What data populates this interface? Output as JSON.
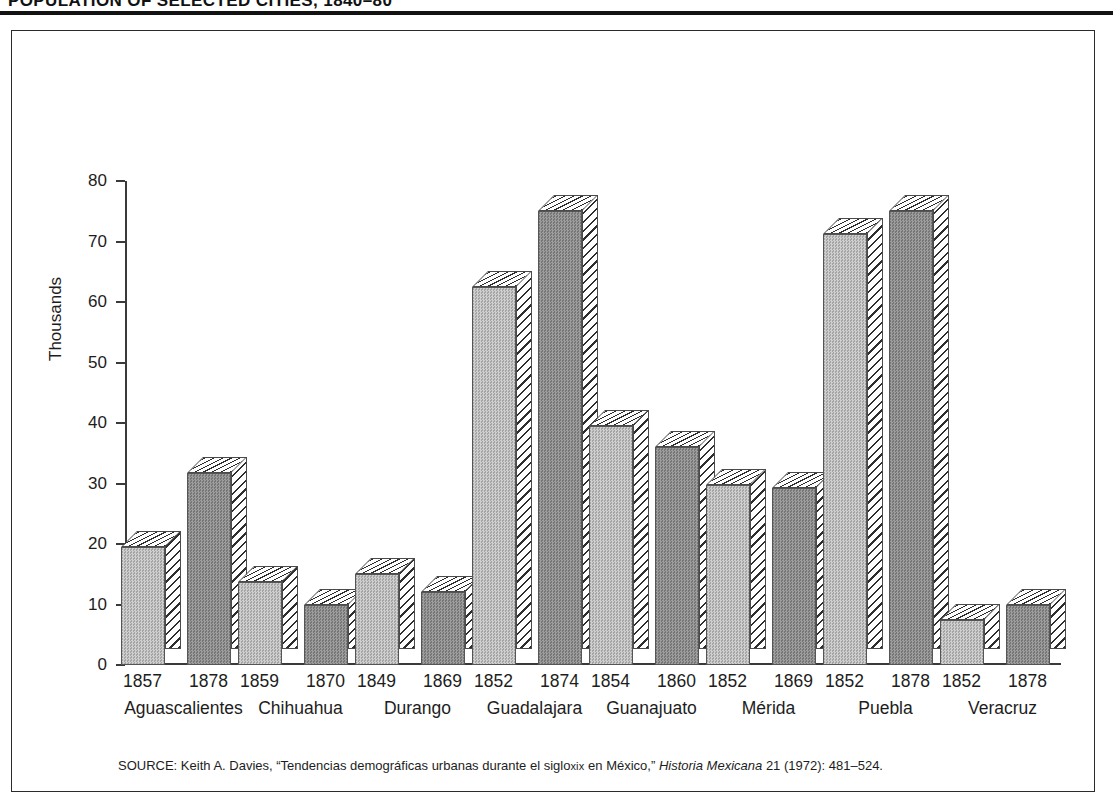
{
  "figure": {
    "title": "POPULATION OF SELECTED CITIES, 1840–80",
    "frame_color": "#2b2b2b"
  },
  "source_note": {
    "prefix": "SOURCE:",
    "author": "Keith A. Davies,",
    "article_open_quote": "“",
    "article_part1": "Tendencias demográficas urbanas durante el siglo",
    "article_smallcaps": "xix",
    "article_part2": "en México,",
    "article_close_quote": "”",
    "journal": "Historia Mexicana",
    "citation": "21 (1972): 481–524."
  },
  "chart_data": {
    "type": "bar",
    "title": "POPULATION OF SELECTED CITIES, 1840–80",
    "xlabel": "",
    "ylabel": "Thousands",
    "ylim": [
      0,
      80
    ],
    "yticks": [
      0,
      10,
      20,
      30,
      40,
      50,
      60,
      70,
      80
    ],
    "ytick_labels": [
      "0",
      "10",
      "20",
      "30",
      "40",
      "50",
      "60",
      "70",
      "80"
    ],
    "grid": false,
    "legend": "none",
    "units": "thousands of inhabitants",
    "categories": [
      "Aguascalientes",
      "Chihuahua",
      "Durango",
      "Guadalajara",
      "Guanajuato",
      "Mérida",
      "Puebla",
      "Veracruz"
    ],
    "series": [
      {
        "name": "earlier year",
        "style": "light",
        "years": [
          "1857",
          "1859",
          "1849",
          "1852",
          "1854",
          "1852",
          "1852",
          "1852"
        ],
        "values": [
          19.5,
          13.7,
          15.1,
          62.5,
          39.5,
          29.7,
          71.3,
          7.5
        ]
      },
      {
        "name": "later year",
        "style": "dark",
        "years": [
          "1878",
          "1870",
          "1869",
          "1874",
          "1860",
          "1869",
          "1878",
          "1878"
        ],
        "values": [
          31.7,
          10.0,
          12.0,
          75.0,
          36.0,
          29.3,
          75.0,
          10.0
        ]
      }
    ],
    "colors": {
      "light_bar": "#b8b8b8",
      "dark_bar": "#8a8a8a",
      "hatch": "#2e2e2e",
      "axis": "#3a3a3a",
      "text": "#1d1d1d"
    }
  }
}
